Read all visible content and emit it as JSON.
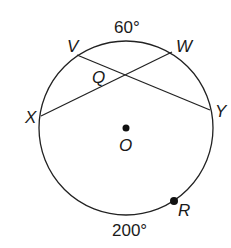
{
  "diagram": {
    "type": "circle-geometry",
    "arcs": {
      "top": "60°",
      "bottom": "200°"
    },
    "points": {
      "V": "V",
      "W": "W",
      "X": "X",
      "Y": "Y",
      "Q": "Q",
      "O": "O",
      "R": "R"
    },
    "chords": [
      "VY",
      "XW"
    ],
    "stroke_color": "#222222"
  }
}
